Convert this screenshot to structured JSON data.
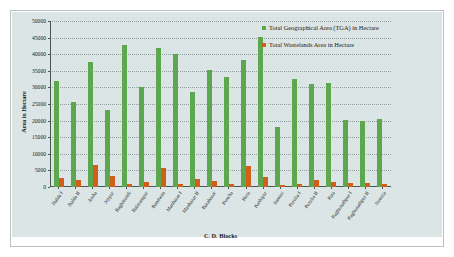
{
  "chart_data": {
    "type": "bar",
    "title": "",
    "xlabel": "C. D. Blocks",
    "ylabel": "Area in Hectare",
    "ylim": [
      0,
      50000
    ],
    "ytick_step": 5000,
    "yticks": [
      0,
      5000,
      10000,
      15000,
      20000,
      25000,
      30000,
      35000,
      40000,
      45000,
      50000
    ],
    "grid": true,
    "legend_position": "top-right",
    "categories": [
      "Jhalda I",
      "Jhalda II",
      "Arsha",
      "Joypur",
      "Baghmundi",
      "Balarampur",
      "Bandwan",
      "Manbazar I",
      "Manbazar II",
      "Barabazar",
      "Puncha",
      "Hura",
      "Kashipur",
      "Santuri",
      "Purulia I",
      "Purulia II",
      "Para",
      "Raghunathpur I",
      "Raghunathpur II",
      "Neturia"
    ],
    "series": [
      {
        "name": "Total Geographical Area (TGA) in Hectare",
        "color": "#5da84e",
        "values": [
          31800,
          25600,
          37700,
          23100,
          42700,
          30000,
          41800,
          40100,
          28600,
          35200,
          33000,
          38400,
          45200,
          18200,
          32500,
          31000,
          31300,
          20300,
          19900,
          20400
        ]
      },
      {
        "name": "Total Wastelands Area in Hectare",
        "color": "#cf5f1b",
        "values": [
          2800,
          2100,
          6700,
          3200,
          900,
          1400,
          5600,
          800,
          2400,
          1700,
          900,
          6300,
          3100,
          500,
          1000,
          2200,
          1500,
          1200,
          1200,
          800
        ]
      }
    ]
  },
  "legend": {
    "items": [
      {
        "label": "Total Geographical Area (TGA) in Hectare"
      },
      {
        "label": "Total Wastelands Area in Hectare"
      }
    ]
  },
  "colors": {
    "tga": "#5da84e",
    "wastelands": "#cf5f1b",
    "canvas": "#dbe5e5",
    "axis": "#4a5555"
  }
}
